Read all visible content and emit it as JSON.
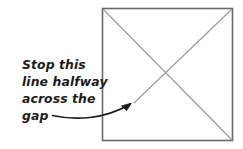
{
  "canvas": {
    "width": 243,
    "height": 149,
    "background_color": "#ffffff"
  },
  "annotation": {
    "label": "Stop this line halfway across the gap",
    "lines": [
      "Stop this",
      "line halfway",
      "across the",
      "gap"
    ],
    "text_color": "#1c1c1c",
    "arrow_color": "#1c1c1c"
  },
  "diagram": {
    "shape_name": "square",
    "border_color": "#6a6a6a",
    "fill_color": "#ffffff",
    "diagonal_color": "#9a9a9a",
    "square": {
      "left": 102,
      "top": 8,
      "right": 233,
      "bottom": 141
    },
    "diagonal_full": {
      "from": "top-left",
      "to": "bottom-right"
    },
    "diagonal_gapped": {
      "from": "top-right",
      "to": "stopped-halfway",
      "stop_point_x": 134,
      "stop_point_y": 103
    }
  }
}
